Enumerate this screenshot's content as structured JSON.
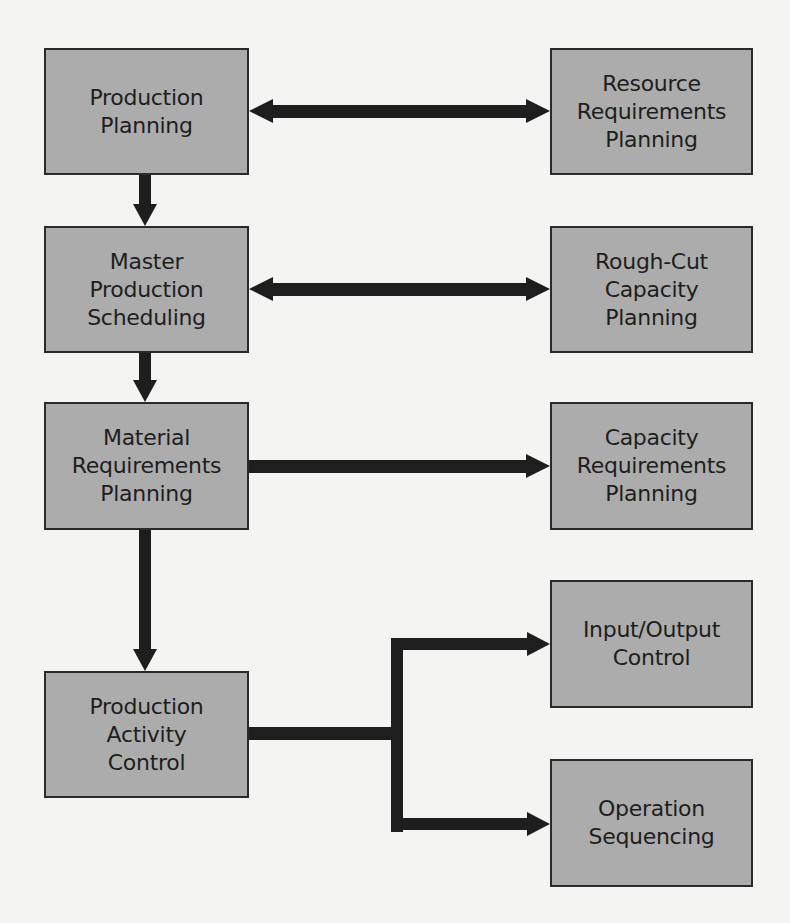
{
  "diagram": {
    "colors": {
      "box_fill": "#acacac",
      "box_border": "#2a2a2a",
      "arrow": "#1e1e1e",
      "background": "#f4f4f2",
      "text": "#1e1e1e"
    },
    "left_column": [
      {
        "id": "production-planning",
        "lines": [
          "Production",
          "Planning"
        ]
      },
      {
        "id": "master-production-scheduling",
        "lines": [
          "Master",
          "Production",
          "Scheduling"
        ]
      },
      {
        "id": "material-requirements-planning",
        "lines": [
          "Material",
          "Requirements",
          "Planning"
        ]
      },
      {
        "id": "production-activity-control",
        "lines": [
          "Production",
          "Activity",
          "Control"
        ]
      }
    ],
    "right_column": [
      {
        "id": "resource-requirements-planning",
        "lines": [
          "Resource",
          "Requirements",
          "Planning"
        ]
      },
      {
        "id": "rough-cut-capacity-planning",
        "lines": [
          "Rough-Cut",
          "Capacity",
          "Planning"
        ]
      },
      {
        "id": "capacity-requirements-planning",
        "lines": [
          "Capacity",
          "Requirements",
          "Planning"
        ]
      },
      {
        "id": "input-output-control",
        "lines": [
          "Input/Output",
          "Control"
        ]
      },
      {
        "id": "operation-sequencing",
        "lines": [
          "Operation",
          "Sequencing"
        ]
      }
    ],
    "connections": [
      {
        "from": "production-planning",
        "to": "resource-requirements-planning",
        "type": "bidirectional"
      },
      {
        "from": "master-production-scheduling",
        "to": "rough-cut-capacity-planning",
        "type": "bidirectional"
      },
      {
        "from": "material-requirements-planning",
        "to": "capacity-requirements-planning",
        "type": "directed"
      },
      {
        "from": "production-planning",
        "to": "master-production-scheduling",
        "type": "directed"
      },
      {
        "from": "master-production-scheduling",
        "to": "material-requirements-planning",
        "type": "directed"
      },
      {
        "from": "material-requirements-planning",
        "to": "production-activity-control",
        "type": "directed"
      },
      {
        "from": "production-activity-control",
        "to": "input-output-control",
        "type": "directed-branch"
      },
      {
        "from": "production-activity-control",
        "to": "operation-sequencing",
        "type": "directed-branch"
      }
    ]
  }
}
